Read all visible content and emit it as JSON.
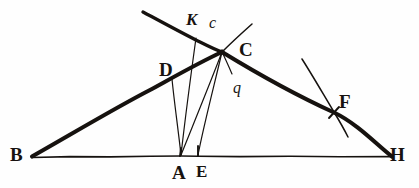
{
  "figure": {
    "background_color": "#fefefe",
    "ink_color": "#16120f",
    "width": 419,
    "height": 188,
    "labels": [
      {
        "id": "B",
        "text": "B",
        "x": 10,
        "y": 145,
        "style": "cap",
        "point_x": 32,
        "point_y": 157
      },
      {
        "id": "D",
        "text": "D",
        "x": 159,
        "y": 60,
        "style": "cap",
        "point_x": 172,
        "point_y": 79
      },
      {
        "id": "K",
        "text": "K",
        "x": 186,
        "y": 11,
        "style": "ital",
        "point_x": 196,
        "point_y": 38
      },
      {
        "id": "c",
        "text": "c",
        "x": 209,
        "y": 15,
        "style": "low",
        "point_x": 214,
        "point_y": 40
      },
      {
        "id": "C",
        "text": "C",
        "x": 239,
        "y": 40,
        "style": "cap",
        "point_x": 222,
        "point_y": 52
      },
      {
        "id": "q",
        "text": "q",
        "x": 233,
        "y": 80,
        "style": "low",
        "point_x": 229,
        "point_y": 74
      },
      {
        "id": "F",
        "text": "F",
        "x": 339,
        "y": 92,
        "style": "cap",
        "point_x": 334,
        "point_y": 112
      },
      {
        "id": "A",
        "text": "A",
        "x": 172,
        "y": 163,
        "style": "cap",
        "point_x": 181,
        "point_y": 156
      },
      {
        "id": "E",
        "text": "E",
        "x": 196,
        "y": 163,
        "style": "cap-sm",
        "point_x": 198,
        "point_y": 156
      },
      {
        "id": "H",
        "text": "H",
        "x": 390,
        "y": 145,
        "style": "cap",
        "point_x": 392,
        "point_y": 157
      }
    ],
    "vertices": {
      "B": [
        32,
        157
      ],
      "A": [
        181,
        156
      ],
      "E": [
        198,
        156
      ],
      "H": [
        392,
        157
      ],
      "C": [
        222,
        52
      ],
      "D": [
        172,
        79
      ],
      "F": [
        334,
        112
      ]
    },
    "segments": [
      {
        "name": "base-line-BH",
        "from": "B",
        "to": "H"
      },
      {
        "name": "side-line-BC",
        "from": "B",
        "to": "C"
      },
      {
        "name": "side-line-CH",
        "from": "C",
        "to": "H"
      },
      {
        "name": "ray-upper-left-to-C",
        "from": "upper-left",
        "to": "C"
      },
      {
        "name": "ray-C-upper-right",
        "from": "C",
        "to": "upper-right"
      },
      {
        "name": "line-D-to-A",
        "from": "D",
        "to": "A"
      },
      {
        "name": "line-K-to-A",
        "from": "K",
        "to": "A"
      },
      {
        "name": "line-C-to-A",
        "from": "C",
        "to": "A"
      },
      {
        "name": "line-C-to-E",
        "from": "C",
        "to": "E"
      },
      {
        "name": "arc-through-F",
        "from": "arc-start",
        "to": "arc-end"
      },
      {
        "name": "tick-at-F",
        "from": "F",
        "to": "F"
      },
      {
        "name": "tick-at-A",
        "from": "A",
        "to": "A"
      },
      {
        "name": "tick-at-E",
        "from": "E",
        "to": "E"
      }
    ]
  }
}
